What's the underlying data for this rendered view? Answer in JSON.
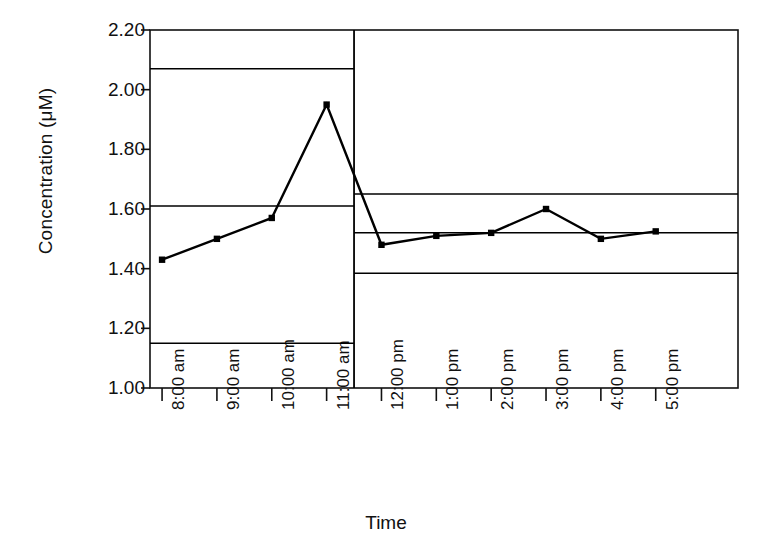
{
  "chart_data": {
    "type": "line",
    "title": "",
    "xlabel": "Time",
    "ylabel": "Concentration (μM)",
    "ylim": [
      1.0,
      2.2
    ],
    "ytick_labels": [
      "1.00",
      "1.20",
      "1.40",
      "1.60",
      "1.80",
      "2.00",
      "2.20"
    ],
    "ytick_values": [
      1.0,
      1.2,
      1.4,
      1.6,
      1.8,
      2.0,
      2.2
    ],
    "grid": false,
    "legend": "none",
    "categories": [
      "8:00 am",
      "9:00 am",
      "10:00 am",
      "11:00 am",
      "12:00 pm",
      "1:00 pm",
      "2:00 pm",
      "3:00 pm",
      "4:00 pm",
      "5:00 pm"
    ],
    "values": [
      1.43,
      1.5,
      1.57,
      1.95,
      1.48,
      1.51,
      1.52,
      1.6,
      1.5,
      1.525
    ],
    "series": [
      {
        "name": "Concentration",
        "values": [
          1.43,
          1.5,
          1.57,
          1.95,
          1.48,
          1.51,
          1.52,
          1.6,
          1.5,
          1.525
        ],
        "marker": "filled-square",
        "color": "#000000"
      }
    ],
    "annotations": [
      {
        "name": "phase-divider",
        "type": "vertical-line",
        "between_categories": [
          "11:00 am",
          "12:00 pm"
        ],
        "color": "#000000"
      }
    ],
    "control_limits": [
      {
        "segment": "morning",
        "categories": [
          "8:00 am",
          "9:00 am",
          "10:00 am",
          "11:00 am"
        ],
        "ucl": 2.07,
        "center": 1.61,
        "lcl": 1.15,
        "color": "#000000"
      },
      {
        "segment": "afternoon",
        "categories": [
          "12:00 pm",
          "1:00 pm",
          "2:00 pm",
          "3:00 pm",
          "4:00 pm",
          "5:00 pm"
        ],
        "ucl": 1.65,
        "center": 1.52,
        "lcl": 1.385,
        "color": "#000000"
      }
    ]
  },
  "axes": {
    "y_axis_title": "Concentration (μM)",
    "x_axis_title": "Time"
  },
  "colors": {
    "line": "#000000",
    "marker": "#000000",
    "frame": "#111111",
    "control_limit": "#111111",
    "background": "#ffffff"
  }
}
